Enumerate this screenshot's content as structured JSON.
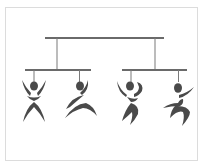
{
  "illustration": {
    "subject": "mobile-hierarchy-of-dancing-figures",
    "colors": {
      "bar": "#6a6a6a",
      "string": "#7a7a7a",
      "figure": "#4a4a4a",
      "frame": "#dcdcdc",
      "background": "#ffffff"
    },
    "figures": [
      {
        "pose": "arms-up"
      },
      {
        "pose": "leaping"
      },
      {
        "pose": "arm-curl"
      },
      {
        "pose": "running"
      }
    ]
  }
}
